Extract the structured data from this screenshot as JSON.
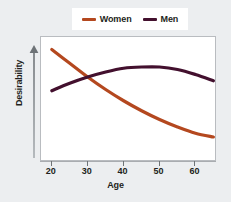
{
  "chart_data": {
    "type": "line",
    "title": "",
    "subtitle": "",
    "xlabel": "Age",
    "ylabel": "Desirability",
    "xlim": [
      17,
      66
    ],
    "ylim": [
      0,
      100
    ],
    "grid": false,
    "legend_position": "top-center",
    "x_ticks": [
      20,
      30,
      40,
      50,
      60
    ],
    "x_tick_labels": [
      "20",
      "30",
      "40",
      "50",
      "60"
    ],
    "y_ticks": [],
    "y_tick_labels": [],
    "y_axis_arrow": true,
    "annotations": [],
    "series": [
      {
        "name": "Women",
        "color": "#b4481f",
        "x": [
          20,
          25,
          30,
          35,
          40,
          45,
          50,
          55,
          60,
          65
        ],
        "values": [
          90,
          79,
          68,
          58,
          49,
          41,
          34,
          28,
          23,
          20
        ]
      },
      {
        "name": "Men",
        "color": "#43102e",
        "x": [
          20,
          25,
          30,
          35,
          40,
          45,
          50,
          55,
          60,
          65
        ],
        "values": [
          57,
          63,
          68,
          72,
          75,
          76,
          76,
          74,
          70,
          65
        ]
      }
    ]
  },
  "legend": {
    "entries": [
      {
        "label": "Women",
        "color": "#b4481f",
        "swatch": "line-swatch"
      },
      {
        "label": "Men",
        "color": "#43102e",
        "swatch": "line-swatch"
      }
    ]
  },
  "axes": {
    "y_title": "Desirability",
    "x_title": "Age",
    "x_tick_labels": [
      "20",
      "30",
      "40",
      "50",
      "60"
    ],
    "arrow_icon": "arrow-up-icon"
  },
  "colors": {
    "page_background": "#eceef0",
    "plot_background": "#ffffff",
    "plot_border": "#b9bcc0",
    "axis": "#6f7477",
    "text": "#231f20",
    "women": "#b4481f",
    "men": "#43102e"
  }
}
